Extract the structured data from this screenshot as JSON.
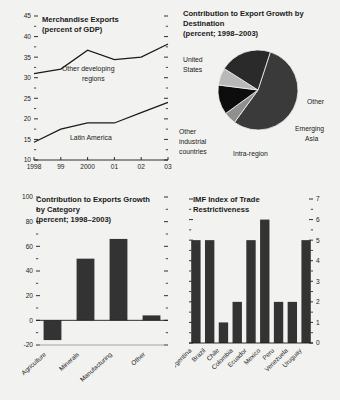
{
  "figure": {
    "background": "#f2f2f0",
    "ink": "#1a1a1a",
    "panel_count": 4
  },
  "chart_data": [
    {
      "id": "merchandise-exports",
      "type": "line",
      "title": "Merchandise Exports",
      "subtitle": "(percent of GDP)",
      "xlabel": "",
      "ylabel": "",
      "x": [
        "1998",
        "99",
        "2000",
        "01",
        "02",
        "03"
      ],
      "ticklabels_x": [
        "1998",
        "99",
        "2000",
        "01",
        "02",
        "03"
      ],
      "ylim": [
        10,
        45
      ],
      "yticks": [
        10,
        15,
        20,
        25,
        30,
        35,
        40,
        45
      ],
      "minor_ticks": true,
      "grid": false,
      "ticks_both_sides": true,
      "series": [
        {
          "name": "Other developing regions",
          "label_lines": [
            "Other developing",
            "regions"
          ],
          "values": [
            31.0,
            32.1,
            36.7,
            34.4,
            35.0,
            38.2
          ],
          "color": "#1a1a1a"
        },
        {
          "name": "Latin America",
          "label_lines": [
            "Latin America"
          ],
          "values": [
            14.3,
            17.5,
            19.0,
            19.0,
            21.5,
            24.0
          ],
          "color": "#1a1a1a"
        }
      ]
    },
    {
      "id": "export-growth-by-destination",
      "type": "pie",
      "title_lines": [
        "Contribution to Export Growth by",
        "Destination"
      ],
      "subtitle": "(percent; 1998–2003)",
      "slices": [
        {
          "label": "United States",
          "label_lines": [
            "United",
            "States"
          ],
          "value": 55,
          "color": "#3a3a3a"
        },
        {
          "label": "Other",
          "label_lines": [
            "Other"
          ],
          "value": 5,
          "color": "#8f8f8f"
        },
        {
          "label": "Emerging Asia",
          "label_lines": [
            "Emerging",
            "Asia"
          ],
          "value": 12,
          "color": "#0d0d0d"
        },
        {
          "label": "Intra-region",
          "label_lines": [
            "Intra-region"
          ],
          "value": 7,
          "color": "#b9b9b9"
        },
        {
          "label": "Other industrial countries",
          "label_lines": [
            "Other",
            "industrial",
            "countries"
          ],
          "value": 21,
          "color": "#2a2a2a"
        }
      ],
      "legend": "labels-outside"
    },
    {
      "id": "exports-growth-by-category",
      "type": "bar",
      "title_lines": [
        "Contribution to Exports Growth",
        "by Category"
      ],
      "subtitle": "(percent; 1998–2003)",
      "categories": [
        "Agriculture",
        "Minerals",
        "Manufacturing",
        "Other"
      ],
      "values": [
        -16,
        50,
        66,
        4
      ],
      "ylim": [
        -20,
        100
      ],
      "yticks": [
        -20,
        0,
        20,
        40,
        60,
        80,
        100
      ],
      "bar_color": "#333333",
      "grid": false,
      "ticks_both_sides": true
    },
    {
      "id": "imf-index-trade-restrictiveness",
      "type": "bar",
      "title_lines": [
        "IMF Index of Trade",
        "Restrictiveness"
      ],
      "subtitle": "",
      "categories": [
        "Argentina",
        "Brazil",
        "Chile",
        "Colombia",
        "Ecuador",
        "Mexico",
        "Peru",
        "Venezuela",
        "Uruguay"
      ],
      "values": [
        5,
        5,
        1,
        2,
        5,
        6,
        2,
        2,
        5
      ],
      "ylim": [
        0,
        7
      ],
      "yticks": [
        0,
        1,
        2,
        3,
        4,
        5,
        6,
        7
      ],
      "yaxis_position": "right",
      "bar_color": "#333333",
      "grid": false,
      "ticks_both_sides": true
    }
  ]
}
